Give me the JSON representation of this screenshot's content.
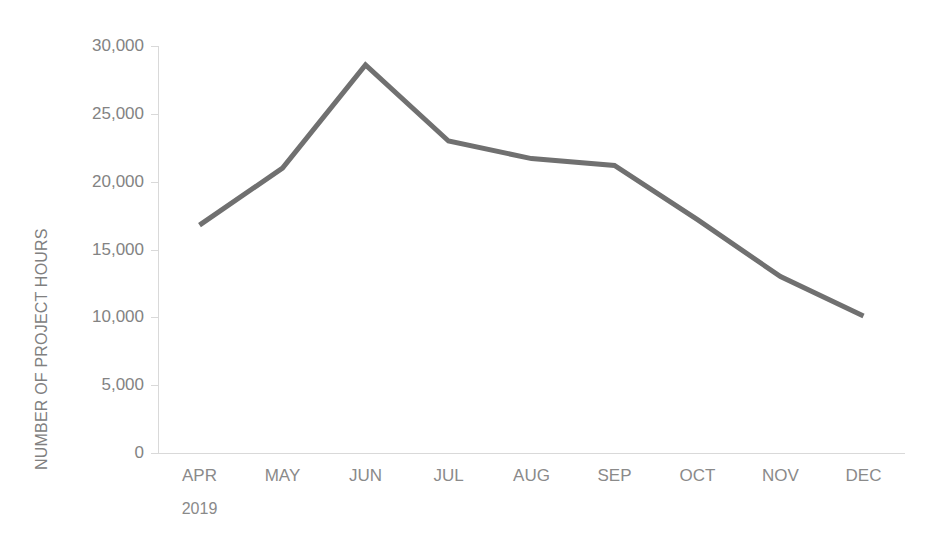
{
  "chart_data": {
    "type": "line",
    "title": "",
    "subtitle": "",
    "xlabel": "",
    "ylabel": "NUMBER OF PROJECT HOURS",
    "categories": [
      "APR",
      "MAY",
      "JUN",
      "JUL",
      "AUG",
      "SEP",
      "OCT",
      "NOV",
      "DEC"
    ],
    "group_label": "2019",
    "values": [
      16800,
      21000,
      28600,
      23000,
      21700,
      21200,
      17200,
      13000,
      10100
    ],
    "series": [
      {
        "name": "Number of project hours",
        "values": [
          16800,
          21000,
          28600,
          23000,
          21700,
          21200,
          17200,
          13000,
          10100
        ]
      }
    ],
    "ylim": [
      0,
      30000
    ],
    "y_ticks": [
      0,
      5000,
      10000,
      15000,
      20000,
      25000,
      30000
    ],
    "y_tick_labels": [
      "0",
      "5,000",
      "10,000",
      "15,000",
      "20,000",
      "25,000",
      "30,000"
    ],
    "grid": false,
    "legend": "none",
    "line_color": "#707070",
    "axis_color": "#d9d9d9",
    "text_color": "#858585"
  }
}
